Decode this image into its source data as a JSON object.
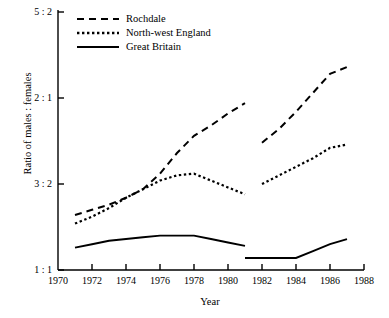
{
  "chart_data": {
    "type": "line",
    "title": "",
    "xlabel": "Year",
    "ylabel": "Ratio of males : females",
    "grid": false,
    "legend_position": "top-left",
    "xlim": [
      1970,
      1988
    ],
    "ylim": [
      1.0,
      2.5
    ],
    "x_ticks": [
      1970,
      1972,
      1974,
      1976,
      1978,
      1980,
      1982,
      1984,
      1986,
      1988
    ],
    "x_tick_labels": [
      "1970",
      "1972",
      "1974",
      "1976",
      "1978",
      "1980",
      "1982",
      "1984",
      "1986",
      "1988"
    ],
    "y_ticks": [
      1.0,
      1.5,
      2.0,
      2.5
    ],
    "y_tick_labels": [
      "1 : 1",
      "3 : 2",
      "2 : 1",
      "5 : 2"
    ],
    "note": "Series are drawn in two separate segments with a discontinuity between 1981 and 1982",
    "series": [
      {
        "name": "Rochdale",
        "style": "dashed",
        "color": "#000000",
        "segments": [
          {
            "x": [
              1971,
              1972,
              1973,
              1974,
              1975,
              1976,
              1977,
              1978,
              1979,
              1980,
              1981
            ],
            "y": [
              1.32,
              1.35,
              1.38,
              1.42,
              1.47,
              1.56,
              1.68,
              1.78,
              1.84,
              1.91,
              1.97
            ]
          },
          {
            "x": [
              1982,
              1983,
              1984,
              1985,
              1986,
              1987
            ],
            "y": [
              1.74,
              1.82,
              1.92,
              2.03,
              2.14,
              2.18
            ]
          }
        ]
      },
      {
        "name": "North-west England",
        "style": "dotted",
        "color": "#000000",
        "segments": [
          {
            "x": [
              1971,
              1972,
              1973,
              1974,
              1975,
              1976,
              1977,
              1978,
              1979,
              1980,
              1981
            ],
            "y": [
              1.27,
              1.31,
              1.36,
              1.42,
              1.47,
              1.52,
              1.55,
              1.56,
              1.52,
              1.48,
              1.44
            ]
          },
          {
            "x": [
              1982,
              1983,
              1984,
              1985,
              1986,
              1987
            ],
            "y": [
              1.5,
              1.55,
              1.6,
              1.65,
              1.71,
              1.73
            ]
          }
        ]
      },
      {
        "name": "Great Britain",
        "style": "solid",
        "color": "#000000",
        "segments": [
          {
            "x": [
              1971,
              1972,
              1973,
              1974,
              1975,
              1976,
              1977,
              1978,
              1979,
              1980,
              1981
            ],
            "y": [
              1.13,
              1.15,
              1.17,
              1.18,
              1.19,
              1.2,
              1.2,
              1.2,
              1.18,
              1.16,
              1.14
            ]
          },
          {
            "x": [
              1981,
              1982,
              1983,
              1984,
              1985,
              1986,
              1987
            ],
            "y": [
              1.07,
              1.07,
              1.07,
              1.07,
              1.11,
              1.15,
              1.18
            ]
          }
        ]
      }
    ]
  },
  "legend": {
    "entries": [
      {
        "label": "Rochdale",
        "style": "dashed"
      },
      {
        "label": "North-west England",
        "style": "dotted"
      },
      {
        "label": "Great Britain",
        "style": "solid"
      }
    ]
  }
}
